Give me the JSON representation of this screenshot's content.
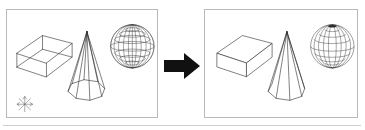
{
  "figure": {
    "top_caption": "",
    "arrow": {
      "icon": "right-arrow-icon",
      "direction": "right",
      "color": "#111111"
    },
    "rule_color": "#d0d0d0",
    "panel_border_color": "#b9b9b9",
    "line_color": "#2b2b2b"
  },
  "panels": [
    {
      "id": "before",
      "name": "wireframe-panel",
      "label": "",
      "render_mode": "wireframe",
      "has_axis_indicator": true,
      "axis_indicator": {
        "icon": "coordinate-axes-icon",
        "label": ""
      },
      "objects": [
        {
          "name": "box",
          "shape": "cuboid",
          "hidden_lines": "visible"
        },
        {
          "name": "cone",
          "shape": "cone",
          "base_sides": 10,
          "hidden_lines": "visible"
        },
        {
          "name": "sphere",
          "shape": "sphere",
          "meridians": 12,
          "parallels": 8,
          "hidden_lines": "visible"
        }
      ]
    },
    {
      "id": "after",
      "name": "hidden-line-removed-panel",
      "label": "",
      "render_mode": "hidden-line-removed",
      "has_axis_indicator": false,
      "objects": [
        {
          "name": "box",
          "shape": "cuboid",
          "hidden_lines": "removed"
        },
        {
          "name": "cone",
          "shape": "cone",
          "base_sides": 10,
          "hidden_lines": "removed"
        },
        {
          "name": "sphere",
          "shape": "sphere",
          "meridians": 12,
          "parallels": 8,
          "hidden_lines": "removed"
        }
      ]
    }
  ]
}
